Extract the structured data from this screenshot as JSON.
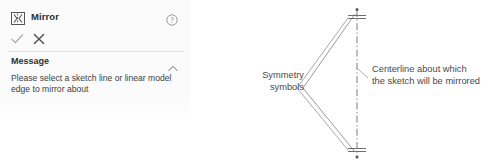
{
  "panel": {
    "title": "Mirror",
    "icon": "mirror-icon",
    "help_icon": "help-circle-icon",
    "accept_icon": "checkmark-icon",
    "cancel_icon": "close-x-icon",
    "section": {
      "label": "Message",
      "collapse_icon": "chevron-up-icon",
      "expanded": true,
      "text": "Please select a sketch line or linear model edge to mirror about"
    },
    "colors": {
      "background": "#fbfbfb",
      "title_text": "#2e2e2e",
      "body_text": "#414141",
      "divider": "#e2e2e2",
      "accept": "#9a9a9a",
      "cancel": "#4a4a4a"
    }
  },
  "diagram": {
    "annotations": {
      "symmetry": "Symmetry\nsymbols",
      "centerline": "Centerline about which\nthe sketch will be mirrored"
    },
    "colors": {
      "geometry_line": "#8a8a8a",
      "centerline": "#7d7d7d",
      "leader": "#9a9a9a",
      "text": "#4a4a4a"
    },
    "geometry": {
      "centerline_x": 137,
      "centerline_top_y": 10,
      "centerline_bottom_y": 156,
      "apex_x": 83,
      "apex_y": 88,
      "symmetry_marks": 2
    }
  }
}
